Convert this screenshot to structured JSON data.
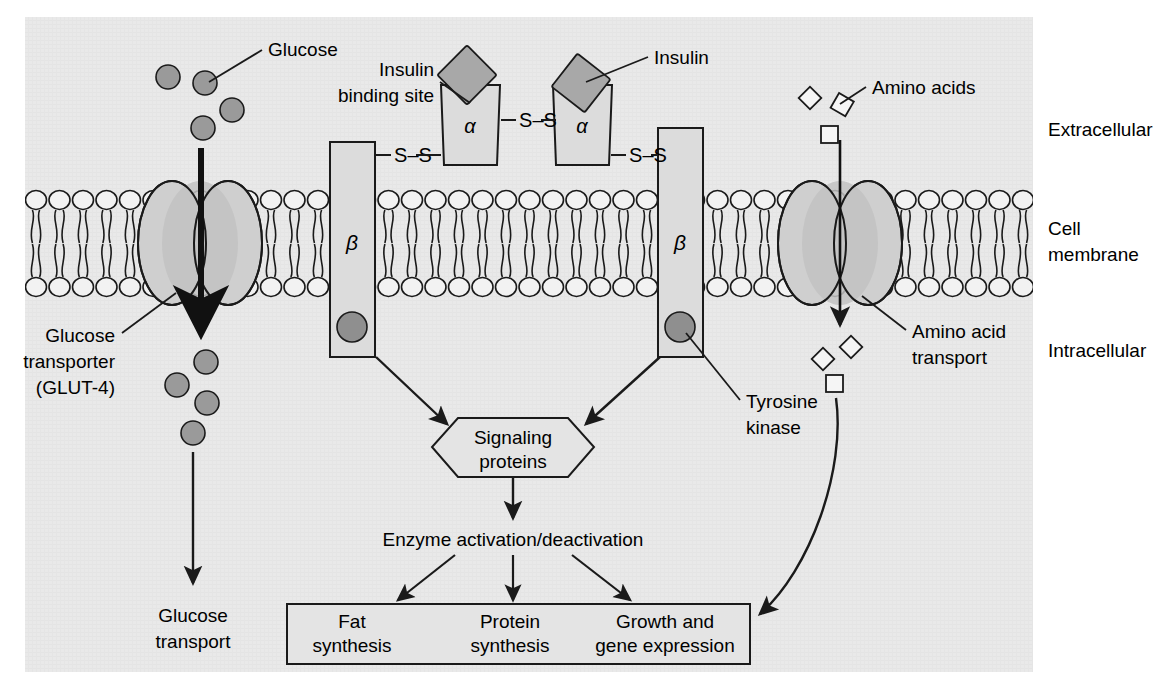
{
  "figure": {
    "panel_bg": "#e8e8e8",
    "shape_fill": "#d2d2d2",
    "dark_fill": "#9a9a9a",
    "stroke": "#1a1a1a"
  },
  "labels": {
    "glucose": "Glucose",
    "insulin_binding_site_line1": "Insulin",
    "insulin_binding_site_line2": "binding site",
    "insulin": "Insulin",
    "amino_acids": "Amino acids",
    "extracellular": "Extracellular",
    "cell_membrane_line1": "Cell",
    "cell_membrane_line2": "membrane",
    "intracellular": "Intracellular",
    "glucose_transporter_line1": "Glucose",
    "glucose_transporter_line2": "transporter",
    "glucose_transporter_line3": "(GLUT-4)",
    "amino_acid_transport_line1": "Amino acid",
    "amino_acid_transport_line2": "transport",
    "tyrosine_kinase_line1": "Tyrosine",
    "tyrosine_kinase_line2": "kinase",
    "signaling_proteins_line1": "Signaling",
    "signaling_proteins_line2": "proteins",
    "enzyme_activation": "Enzyme activation/deactivation",
    "glucose_transport_line1": "Glucose",
    "glucose_transport_line2": "transport",
    "alpha": "α",
    "beta": "β",
    "disulfide": "S–S"
  },
  "outcomes": [
    {
      "line1": "Fat",
      "line2": "synthesis"
    },
    {
      "line1": "Protein",
      "line2": "synthesis"
    },
    {
      "line1": "Growth and",
      "line2": "gene expression"
    }
  ],
  "receptor": {
    "alpha_subunits": [
      "α",
      "α"
    ],
    "beta_subunits": [
      "β",
      "β"
    ],
    "disulfide_bonds": [
      "S–S",
      "S–S",
      "S–S"
    ]
  },
  "molecules": {
    "glucose_extracellular_count": 4,
    "glucose_intracellular_count": 4,
    "insulin_count": 2,
    "amino_acid_extracellular_count": 3,
    "amino_acid_intracellular_count": 3
  },
  "chart_data": {
    "type": "diagram",
    "nodes": [
      "Glucose",
      "Insulin",
      "Amino acids",
      "Glucose transporter (GLUT-4)",
      "Insulin receptor",
      "Amino acid transport",
      "Tyrosine kinase",
      "Signaling proteins",
      "Enzyme activation/deactivation",
      "Fat synthesis",
      "Protein synthesis",
      "Growth and gene expression",
      "Glucose transport"
    ],
    "edges": [
      {
        "from": "Glucose transporter (GLUT-4)",
        "to": "Glucose transport"
      },
      {
        "from": "Insulin receptor beta (left)",
        "to": "Signaling proteins"
      },
      {
        "from": "Insulin receptor beta (right)",
        "to": "Signaling proteins"
      },
      {
        "from": "Signaling proteins",
        "to": "Enzyme activation/deactivation"
      },
      {
        "from": "Enzyme activation/deactivation",
        "to": "Fat synthesis"
      },
      {
        "from": "Enzyme activation/deactivation",
        "to": "Protein synthesis"
      },
      {
        "from": "Enzyme activation/deactivation",
        "to": "Growth and gene expression"
      },
      {
        "from": "Amino acid transport",
        "to": "Growth and gene expression"
      }
    ],
    "regions": [
      "Extracellular",
      "Cell membrane",
      "Intracellular"
    ]
  }
}
